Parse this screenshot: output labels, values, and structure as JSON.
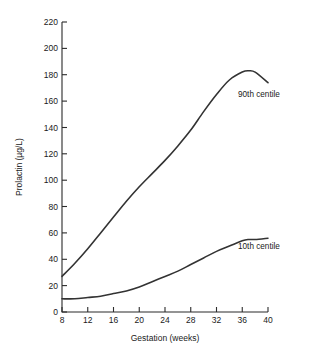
{
  "chart_data": {
    "type": "line",
    "title": "",
    "xlabel": "Gestation (weeks)",
    "ylabel": "Prolactin (µg/L)",
    "xlim": [
      8,
      40
    ],
    "ylim": [
      0,
      220
    ],
    "xticks": [
      8,
      12,
      16,
      20,
      24,
      28,
      32,
      36,
      40
    ],
    "yticks": [
      0,
      20,
      40,
      60,
      80,
      100,
      120,
      140,
      160,
      180,
      200,
      220
    ],
    "grid": false,
    "legend_position": "inline-annotation",
    "x": [
      8,
      10,
      12,
      14,
      16,
      18,
      20,
      22,
      24,
      26,
      28,
      30,
      32,
      34,
      36,
      37,
      38,
      40
    ],
    "series": [
      {
        "name": "90th centile",
        "color": "#333333",
        "values": [
          27,
          37,
          48,
          60,
          72,
          84,
          95,
          105,
          115,
          126,
          138,
          152,
          165,
          176,
          182,
          183,
          182,
          174
        ],
        "annotation": "90th centile"
      },
      {
        "name": "10th centile",
        "color": "#333333",
        "values": [
          10,
          10,
          11,
          12,
          14,
          16,
          19,
          23,
          27,
          31,
          36,
          41,
          46,
          50,
          54,
          55,
          55,
          56
        ],
        "annotation": "10th centile"
      }
    ]
  },
  "axes": {
    "x_tick_labels": [
      "8",
      "12",
      "16",
      "20",
      "24",
      "28",
      "32",
      "36",
      "40"
    ],
    "y_tick_labels": [
      "0",
      "20",
      "40",
      "60",
      "80",
      "100",
      "120",
      "140",
      "160",
      "180",
      "200",
      "220"
    ],
    "x_axis_title": "Gestation (weeks)",
    "y_axis_title": "Prolactin (µg/L)"
  },
  "annotations": {
    "upper_curve_label": "90th centile",
    "lower_curve_label": "10th centile"
  },
  "colors": {
    "background": "#ffffff",
    "axis": "#2b2b2b",
    "curve": "#333333",
    "text": "#1a1a1a"
  }
}
